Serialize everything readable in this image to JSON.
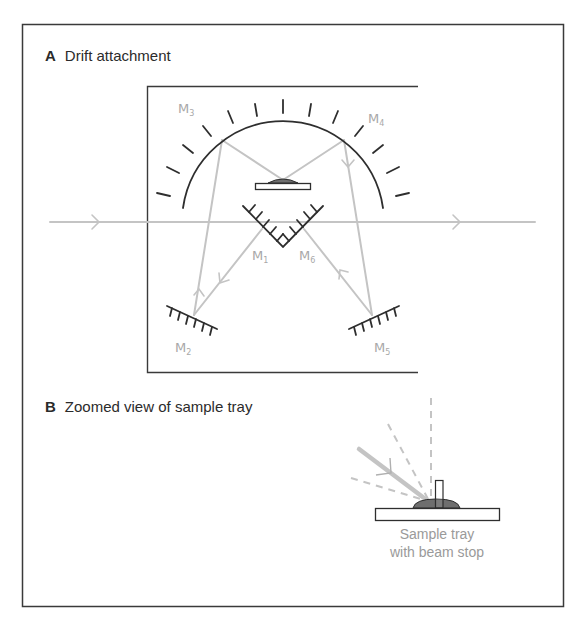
{
  "figure": {
    "panel_a": {
      "letter": "A",
      "title": "Drift attachment",
      "mirrors": [
        {
          "id": "M1",
          "base": "M",
          "sub": "1"
        },
        {
          "id": "M2",
          "base": "M",
          "sub": "2"
        },
        {
          "id": "M3",
          "base": "M",
          "sub": "3"
        },
        {
          "id": "M4",
          "base": "M",
          "sub": "4"
        },
        {
          "id": "M5",
          "base": "M",
          "sub": "5"
        },
        {
          "id": "M6",
          "base": "M",
          "sub": "6"
        }
      ]
    },
    "panel_b": {
      "letter": "B",
      "title": "Zoomed view of sample tray",
      "caption_line1": "Sample tray",
      "caption_line2": "with beam stop"
    },
    "colors": {
      "frame": "#3a3a3a",
      "beam": "#c4c4c4",
      "mirror": "#2e2e2e",
      "label": "#a8a8a8",
      "sample": "#6e6e6e"
    }
  }
}
